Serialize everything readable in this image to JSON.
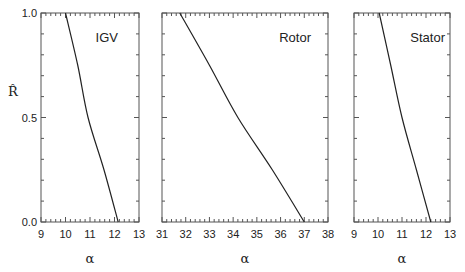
{
  "chart_data": [
    {
      "type": "line",
      "title": "IGV",
      "xlabel": "α",
      "ylabel": "R̂",
      "xlim": [
        9,
        13
      ],
      "ylim": [
        0.0,
        1.0
      ],
      "xticks": [
        "9",
        "10",
        "11",
        "12",
        "13"
      ],
      "yticks": [
        "0.0",
        "0.5",
        "1.0"
      ],
      "grid": false,
      "series": [
        {
          "name": "IGV",
          "x": [
            10.0,
            10.5,
            10.92,
            11.57,
            12.15
          ],
          "y": [
            1.0,
            0.75,
            0.5,
            0.25,
            0.0
          ]
        }
      ]
    },
    {
      "type": "line",
      "title": "Rotor",
      "xlabel": "α",
      "ylabel": "",
      "xlim": [
        31,
        38
      ],
      "ylim": [
        0.0,
        1.0
      ],
      "xticks": [
        "31",
        "32",
        "33",
        "34",
        "35",
        "36",
        "37",
        "38"
      ],
      "yticks": [],
      "grid": false,
      "series": [
        {
          "name": "Rotor",
          "x": [
            31.75,
            33.0,
            34.2,
            35.65,
            37.0
          ],
          "y": [
            1.0,
            0.75,
            0.5,
            0.25,
            0.0
          ]
        }
      ]
    },
    {
      "type": "line",
      "title": "Stator",
      "xlabel": "α",
      "ylabel": "",
      "xlim": [
        9,
        13
      ],
      "ylim": [
        0.0,
        1.0
      ],
      "xticks": [
        "9",
        "10",
        "11",
        "12",
        "13"
      ],
      "yticks": [],
      "grid": false,
      "series": [
        {
          "name": "Stator",
          "x": [
            10.05,
            10.53,
            11.0,
            11.6,
            12.2
          ],
          "y": [
            1.0,
            0.75,
            0.5,
            0.25,
            0.0
          ]
        }
      ]
    }
  ]
}
